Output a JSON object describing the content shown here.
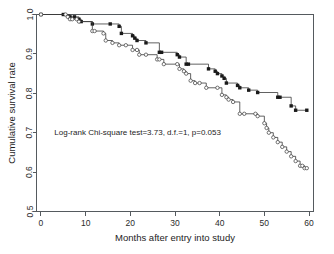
{
  "chart_data": {
    "type": "line",
    "title": "",
    "xlabel": "Months after entry into study",
    "ylabel": "Cumulative survival rate",
    "xlim": [
      -1,
      61
    ],
    "ylim": [
      0.5,
      1.0
    ],
    "xticks": [
      0,
      10,
      20,
      30,
      40,
      50,
      60
    ],
    "xticklabels": [
      "0",
      "10",
      "20",
      "30",
      "40",
      "50",
      "60"
    ],
    "yticks": [
      0.5,
      0.6,
      0.7,
      0.8,
      0.9,
      1.0
    ],
    "yticklabels": [
      "0.5",
      "0.6",
      "0.7",
      "0.8",
      "0.9",
      "1.0"
    ],
    "grid": false,
    "legend": "none",
    "annotations": [
      {
        "text": "Log-rank Chi-square test=3.73, d.f.=1, p=0.053",
        "x": 3,
        "y": 0.695
      }
    ],
    "series": [
      {
        "name": "group-1",
        "marker": "filled-square",
        "x": [
          0,
          5,
          6.5,
          7.5,
          8.5,
          9,
          11.5,
          15.5,
          17.5,
          18,
          20.5,
          21,
          21.5,
          23.5,
          26.5,
          27,
          30.5,
          31,
          32.5,
          33,
          37.5,
          39,
          39.5,
          40.5,
          41,
          41.5,
          44,
          44.5,
          46.5,
          48.5,
          53,
          53.5,
          56,
          57,
          59.5
        ],
        "y": [
          1.0,
          1.0,
          0.994,
          0.994,
          0.988,
          0.982,
          0.976,
          0.976,
          0.97,
          0.952,
          0.946,
          0.94,
          0.934,
          0.928,
          0.904,
          0.904,
          0.898,
          0.892,
          0.874,
          0.874,
          0.862,
          0.856,
          0.85,
          0.844,
          0.838,
          0.826,
          0.82,
          0.814,
          0.808,
          0.802,
          0.79,
          0.79,
          0.768,
          0.757,
          0.757
        ]
      },
      {
        "name": "group-2",
        "marker": "open-circle",
        "x": [
          0,
          5.5,
          6,
          6.5,
          7,
          8,
          8.5,
          11.5,
          12,
          14,
          14.5,
          16,
          17.5,
          19,
          20.5,
          21.5,
          22,
          23.5,
          26,
          26.5,
          27.5,
          30.5,
          31,
          32,
          32.5,
          33.5,
          34.5,
          35.5,
          37,
          39.5,
          40.5,
          41.5,
          42,
          43,
          44.5,
          45.5,
          48,
          48.5,
          50,
          50.5,
          51,
          52,
          53,
          54,
          55,
          56,
          57,
          58,
          58.5,
          59,
          59.5
        ],
        "y": [
          1.0,
          1.0,
          0.994,
          0.988,
          0.988,
          0.988,
          0.982,
          0.958,
          0.958,
          0.952,
          0.934,
          0.928,
          0.922,
          0.922,
          0.91,
          0.91,
          0.898,
          0.898,
          0.886,
          0.886,
          0.874,
          0.874,
          0.862,
          0.856,
          0.85,
          0.832,
          0.826,
          0.826,
          0.814,
          0.814,
          0.796,
          0.79,
          0.784,
          0.778,
          0.748,
          0.748,
          0.748,
          0.742,
          0.724,
          0.712,
          0.7,
          0.688,
          0.676,
          0.664,
          0.652,
          0.64,
          0.628,
          0.616,
          0.616,
          0.61,
          0.61
        ]
      }
    ]
  }
}
